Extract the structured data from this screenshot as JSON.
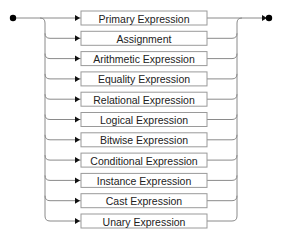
{
  "diagram": {
    "type": "railroad",
    "start_marker": "start-dot",
    "end_marker": "end-arrow-dot",
    "choices": [
      {
        "label": "Primary Expression"
      },
      {
        "label": "Assignment"
      },
      {
        "label": "Arithmetic Expression"
      },
      {
        "label": "Equality Expression"
      },
      {
        "label": "Relational Expression"
      },
      {
        "label": "Logical Expression"
      },
      {
        "label": "Bitwise Expression"
      },
      {
        "label": "Conditional Expression"
      },
      {
        "label": "Instance Expression"
      },
      {
        "label": "Cast Expression"
      },
      {
        "label": "Unary Expression"
      }
    ],
    "colors": {
      "track": "#8a8a8a",
      "box_border": "#9a9a9a",
      "text": "#222222",
      "marker": "#000000"
    }
  }
}
